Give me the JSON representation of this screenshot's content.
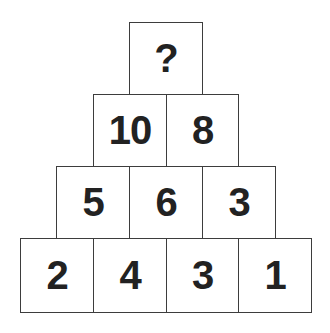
{
  "puzzle": {
    "rows": [
      {
        "cells": [
          {
            "value": "?"
          }
        ]
      },
      {
        "cells": [
          {
            "value": "10"
          },
          {
            "value": "8"
          }
        ]
      },
      {
        "cells": [
          {
            "value": "5"
          },
          {
            "value": "6"
          },
          {
            "value": "3"
          }
        ]
      },
      {
        "cells": [
          {
            "value": "2"
          },
          {
            "value": "4"
          },
          {
            "value": "3"
          },
          {
            "value": "1"
          }
        ]
      }
    ]
  },
  "colors": {
    "border": "#3d3d3d",
    "text": "#222222",
    "background": "#ffffff"
  }
}
